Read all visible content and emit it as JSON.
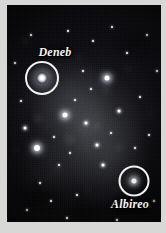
{
  "figure": {
    "kind": "astrophotograph",
    "border_color": "#d8d8d6",
    "sky_color": "#08080b",
    "annotation_color": "#f2f2f0"
  },
  "markers": [
    {
      "id": "deneb",
      "label": "Deneb",
      "circle": {
        "cx": 35,
        "cy": 73,
        "r": 17
      },
      "label_pos": {
        "x": 48,
        "y": 47
      }
    },
    {
      "id": "albireo",
      "label": "Albireo",
      "circle": {
        "cx": 127,
        "cy": 176,
        "r": 15.5
      },
      "label_pos": {
        "x": 123,
        "y": 199
      }
    }
  ],
  "stars": [
    {
      "x": 35,
      "y": 73,
      "size": 11,
      "class": "huge"
    },
    {
      "x": 127,
      "y": 176,
      "size": 5,
      "class": "bright"
    },
    {
      "x": 30,
      "y": 143,
      "size": 6,
      "class": "bright"
    },
    {
      "x": 58,
      "y": 110,
      "size": 5,
      "class": "bright"
    },
    {
      "x": 100,
      "y": 73,
      "size": 5,
      "class": "bright"
    },
    {
      "x": 18,
      "y": 123,
      "size": 3,
      "class": "mid"
    },
    {
      "x": 47,
      "y": 132,
      "size": 2,
      "class": "dim"
    },
    {
      "x": 68,
      "y": 95,
      "size": 2,
      "class": "dim"
    },
    {
      "x": 79,
      "y": 118,
      "size": 3,
      "class": "mid"
    },
    {
      "x": 90,
      "y": 140,
      "size": 3,
      "class": "mid"
    },
    {
      "x": 112,
      "y": 106,
      "size": 3,
      "class": "mid"
    },
    {
      "x": 133,
      "y": 92,
      "size": 2,
      "class": "dim"
    },
    {
      "x": 142,
      "y": 130,
      "size": 2,
      "class": "dim"
    },
    {
      "x": 120,
      "y": 48,
      "size": 2,
      "class": "dim"
    },
    {
      "x": 86,
      "y": 36,
      "size": 2,
      "class": "dim"
    },
    {
      "x": 61,
      "y": 26,
      "size": 2,
      "class": "dim"
    },
    {
      "x": 105,
      "y": 22,
      "size": 2,
      "class": "dim"
    },
    {
      "x": 140,
      "y": 30,
      "size": 2,
      "class": "dim"
    },
    {
      "x": 24,
      "y": 30,
      "size": 2,
      "class": "dim"
    },
    {
      "x": 14,
      "y": 96,
      "size": 2,
      "class": "dim"
    },
    {
      "x": 52,
      "y": 160,
      "size": 2,
      "class": "dim"
    },
    {
      "x": 33,
      "y": 178,
      "size": 2,
      "class": "dim"
    },
    {
      "x": 70,
      "y": 190,
      "size": 2,
      "class": "dim"
    },
    {
      "x": 96,
      "y": 160,
      "size": 3,
      "class": "mid"
    },
    {
      "x": 147,
      "y": 196,
      "size": 2,
      "class": "dim"
    },
    {
      "x": 20,
      "y": 205,
      "size": 2,
      "class": "dim"
    },
    {
      "x": 60,
      "y": 213,
      "size": 2,
      "class": "dim"
    },
    {
      "x": 110,
      "y": 215,
      "size": 2,
      "class": "dim"
    },
    {
      "x": 76,
      "y": 66,
      "size": 2,
      "class": "dim"
    },
    {
      "x": 44,
      "y": 196,
      "size": 2,
      "class": "dim"
    },
    {
      "x": 128,
      "y": 143,
      "size": 2,
      "class": "dim"
    },
    {
      "x": 150,
      "y": 66,
      "size": 2,
      "class": "dim"
    },
    {
      "x": 8,
      "y": 58,
      "size": 2,
      "class": "dim"
    },
    {
      "x": 63,
      "y": 148,
      "size": 2,
      "class": "dim"
    },
    {
      "x": 104,
      "y": 128,
      "size": 2,
      "class": "dim"
    },
    {
      "x": 84,
      "y": 84,
      "size": 2,
      "class": "dim"
    }
  ]
}
